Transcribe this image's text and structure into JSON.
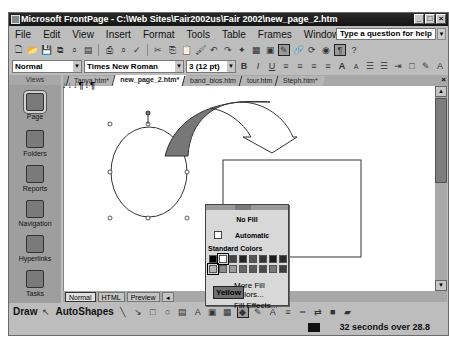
{
  "window": {
    "title": "Microsoft FrontPage - C:\\Web Sites\\Fair2002us\\Fair 2002\\new_page_2.htm",
    "controls": [
      "_",
      "□",
      "×"
    ]
  },
  "menubar": {
    "items": [
      "File",
      "Edit",
      "View",
      "Insert",
      "Format",
      "Tools",
      "Table",
      "Frames",
      "Window",
      "Help"
    ],
    "help_box_placeholder": "Type a question for help"
  },
  "formatting": {
    "style": "Normal",
    "font": "Times New Roman",
    "size": "3 (12 pt)"
  },
  "views": {
    "header": "Views",
    "items": [
      "Page",
      "Folders",
      "Reports",
      "Navigation",
      "Hyperlinks",
      "Tasks"
    ],
    "active": "Page"
  },
  "doc_tabs": {
    "items": [
      "Tanya.htm*",
      "new_page_2.htm*",
      "band_bios.htm",
      "tour.htm",
      "Steph.htm*"
    ],
    "active": "new_page_2.htm*"
  },
  "document": {
    "text": "↓↓↓¶↓¶"
  },
  "pane_tabs": [
    "Normal",
    "HTML",
    "Preview"
  ],
  "fill_popup": {
    "no_fill": "No Fill",
    "automatic": "Automatic",
    "standard_colors_label": "Standard Colors",
    "colors_row1": [
      "#000000",
      "#ffffff",
      "#444444",
      "#222222",
      "#555555",
      "#333333",
      "#1a1a1a",
      "#2b2b2b"
    ],
    "colors_row2": [
      "#b5b5b5",
      "#8a8a8a",
      "#999999",
      "#666666",
      "#5a5a5a",
      "#4a4a4a",
      "#777777",
      "#3d3d3d"
    ],
    "more_fill_colors": "More Fill Colors...",
    "fill_effects": "Fill Effects...",
    "tooltip": "Yellow"
  },
  "drawbar": {
    "draw": "Draw",
    "autoshapes": "AutoShapes"
  },
  "status": {
    "text": "32 seconds over 28.8"
  }
}
